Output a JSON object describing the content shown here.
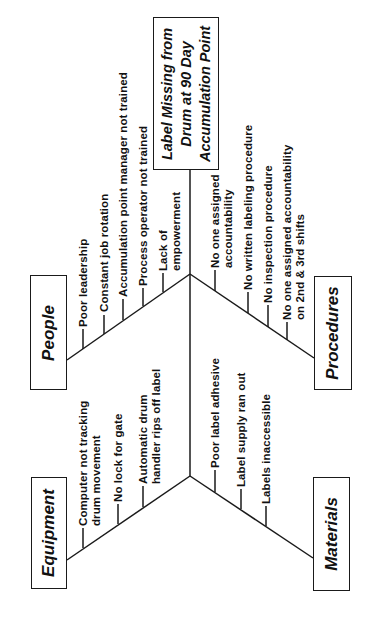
{
  "diagram": {
    "type": "fishbone",
    "orientation": "rotated-90-ccw",
    "effect": {
      "lines": [
        "Label Missing from",
        "Drum at 90 Day",
        "Accumulation Point"
      ]
    },
    "categories": {
      "people": {
        "label": "People",
        "causes": [
          "Poor leadership",
          "Constant job rotation",
          "Accumulation point manager not trained",
          "Process operator not trained",
          "Lack of\nempowerment"
        ]
      },
      "procedures": {
        "label": "Procedures",
        "causes": [
          "No one assigned\naccountability",
          "No written labeling procedure",
          "No inspection procedure",
          "No one assigned accountability\non 2nd & 3rd shifts"
        ]
      },
      "equipment": {
        "label": "Equipment",
        "causes": [
          "Computer not tracking\ndrum movement",
          "No lock for gate",
          "Automatic drum\nhandler rips off label"
        ]
      },
      "materials": {
        "label": "Materials",
        "causes": [
          "Poor label adhesive",
          "Label supply ran out",
          "Labels inaccessible"
        ]
      }
    },
    "colors": {
      "line": "#1a1a1a",
      "text": "#111111",
      "background": "#ffffff"
    }
  }
}
